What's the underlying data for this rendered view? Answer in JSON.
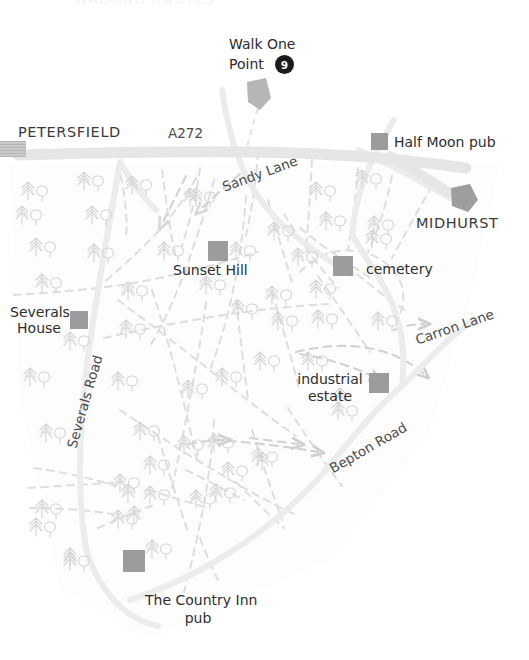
{
  "map": {
    "title_cropped": "WALKING ROUTES",
    "width": 529,
    "height": 660,
    "background": "#ffffff",
    "colors": {
      "major_road": "#e8e8e8",
      "minor_road": "#ececec",
      "footpath_dashed": "#d8d8d8",
      "tree": "#d6d6d6",
      "building_marker": "#9a9a9a",
      "waypoint_badge": "#1b1b1b",
      "label_text": "#2c2c2c"
    }
  },
  "waypoint": {
    "label_line1": "Walk One",
    "label_line2": "Point",
    "number": "9"
  },
  "places": [
    {
      "name": "PETERSFIELD",
      "marker": "hatched-rect",
      "x": 22,
      "y": 130
    },
    {
      "name": "MIDHURST",
      "marker": "pentagon-arrow",
      "x": 417,
      "y": 216
    }
  ],
  "pois": [
    {
      "name": "Half Moon pub",
      "marker": "grey-square",
      "x": 394,
      "y": 135
    },
    {
      "name": "Sunset Hill",
      "marker": "grey-square",
      "x": 173,
      "y": 263
    },
    {
      "name": "cemetery",
      "marker": "grey-square",
      "x": 366,
      "y": 262
    },
    {
      "name": "Severals House",
      "marker": "grey-square",
      "x": 12,
      "y": 305
    },
    {
      "name": "industrial estate",
      "marker": "grey-square",
      "x": 299,
      "y": 375
    },
    {
      "name": "The Country Inn pub",
      "marker": "grey-square",
      "x": 145,
      "y": 593
    }
  ],
  "poi_labels": {
    "half_moon": "Half Moon pub",
    "sunset_hill": "Sunset Hill",
    "cemetery": "cemetery",
    "severals_house_l1": "Severals",
    "severals_house_l2": "House",
    "industrial_l1": "industrial",
    "industrial_l2": "estate",
    "country_inn_l1": "The Country Inn",
    "country_inn_l2": "pub"
  },
  "roads": [
    {
      "name": "A272",
      "type": "major",
      "rotation": 0
    },
    {
      "name": "Sandy Lane",
      "type": "minor",
      "rotation": -20
    },
    {
      "name": "Severals Road",
      "type": "minor",
      "rotation": -74
    },
    {
      "name": "Carron Lane",
      "type": "minor",
      "rotation": -19
    },
    {
      "name": "Bepton Road",
      "type": "minor",
      "rotation": -30
    }
  ],
  "road_labels": {
    "a272": "A272",
    "sandy_lane": "Sandy Lane",
    "severals_road": "Severals Road",
    "carron_lane": "Carron Lane",
    "bepton_road": "Bepton Road"
  },
  "legend_note": ""
}
